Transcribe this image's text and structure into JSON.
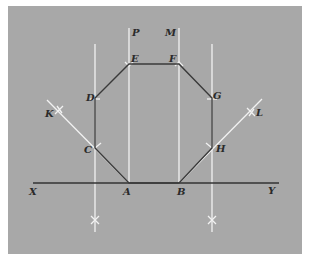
{
  "figure": {
    "background_color": "#a8a8a8",
    "construction_line_color": "#f2f2f2",
    "shape_line_color": "#3a3a3a",
    "baseline": {
      "start_label": "X",
      "end_label": "Y"
    },
    "octagon_vertices": [
      {
        "label": "A",
        "x": 129,
        "y": 183
      },
      {
        "label": "B",
        "x": 179,
        "y": 183
      },
      {
        "label": "H",
        "x": 212,
        "y": 148
      },
      {
        "label": "G",
        "x": 212,
        "y": 98
      },
      {
        "label": "F",
        "x": 179,
        "y": 64
      },
      {
        "label": "E",
        "x": 129,
        "y": 64
      },
      {
        "label": "D",
        "x": 95,
        "y": 98
      },
      {
        "label": "C",
        "x": 95,
        "y": 148
      }
    ],
    "construction_labels": {
      "p": "P",
      "m": "M",
      "k": "K",
      "l": "L"
    }
  },
  "labels": {
    "x": "X",
    "y": "Y",
    "a": "A",
    "b": "B",
    "c": "C",
    "d": "D",
    "e": "E",
    "f": "F",
    "g": "G",
    "h": "H",
    "p": "P",
    "m": "M",
    "k": "K",
    "l": "L"
  }
}
